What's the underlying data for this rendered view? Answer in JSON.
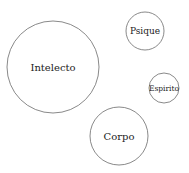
{
  "diagram": {
    "type": "bubble-diagram",
    "nodes": [
      {
        "id": "intelecto",
        "label": "Intelecto",
        "cx": 53,
        "cy": 67,
        "r": 46,
        "font_size": 10
      },
      {
        "id": "psique",
        "label": "Psique",
        "cx": 145,
        "cy": 31,
        "r": 19,
        "font_size": 9
      },
      {
        "id": "espirito",
        "label": "Espirito",
        "cx": 164,
        "cy": 88,
        "r": 15,
        "font_size": 7.5
      },
      {
        "id": "corpo",
        "label": "Corpo",
        "cx": 119,
        "cy": 136,
        "r": 29,
        "font_size": 10
      }
    ],
    "stroke_color": "#6b6b6b",
    "background": "#ffffff"
  }
}
